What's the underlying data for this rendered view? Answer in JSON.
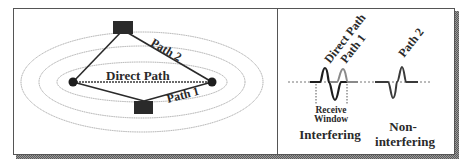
{
  "left_panel": {
    "labels": {
      "direct_path": "Direct Path",
      "path1": "Path 1",
      "path2": "Path 2"
    },
    "nodes": [
      "transmitter-node",
      "receiver-node"
    ],
    "reflectors": [
      "reflector-top",
      "reflector-bottom"
    ]
  },
  "right_panel": {
    "labels": {
      "direct_path": "Direct Path",
      "path1": "Path 1",
      "path2": "Path 2",
      "receive_window_line1": "Receive",
      "receive_window_line2": "Window",
      "interfering": "Interfering",
      "non_interfering_line1": "Non-",
      "non_interfering_line2": "interfering"
    }
  },
  "colors": {
    "stroke": "#2a2a2a",
    "ellipse": "#9a9a9a",
    "shadow": "#7a7a7a",
    "border": "#555555"
  }
}
